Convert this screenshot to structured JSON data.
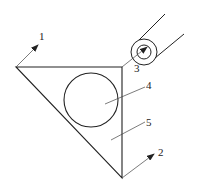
{
  "diagram": {
    "type": "technical-line-drawing",
    "labels": {
      "l1": "1",
      "l2": "2",
      "l3": "3",
      "l4": "4",
      "l5": "5"
    },
    "colors": {
      "line": "#222222",
      "background": "#ffffff"
    }
  }
}
